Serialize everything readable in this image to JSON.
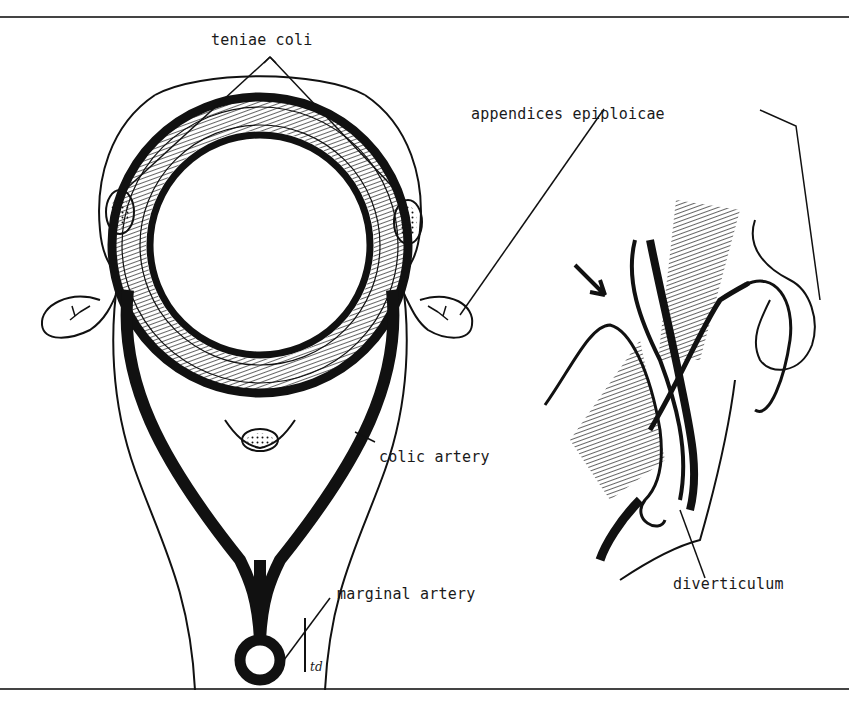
{
  "figure": {
    "type": "anatomical line drawing",
    "left_panel": "cross-section of colon",
    "right_panel": "diverticulum through muscle wall"
  },
  "labels": {
    "teniae_coli": "teniae coli",
    "appendices_epiploicae": "appendices epiploicae",
    "colic_artery": "colic artery",
    "marginal_artery": "marginal artery",
    "diverticulum": "diverticulum",
    "signature": "td"
  },
  "colors": {
    "ink": "#111111",
    "background": "#ffffff",
    "rule": "#444444"
  }
}
